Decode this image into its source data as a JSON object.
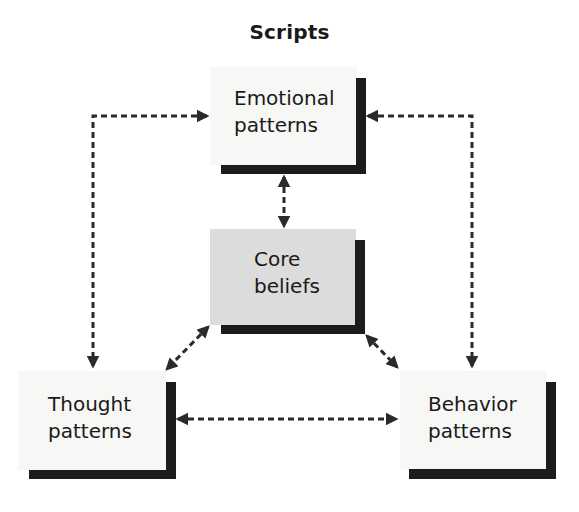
{
  "title": "Scripts",
  "nodes": {
    "emotional": {
      "line1": "Emotional",
      "line2": "patterns"
    },
    "core": {
      "line1": "Core",
      "line2": "beliefs"
    },
    "thought": {
      "line1": "Thought",
      "line2": "patterns"
    },
    "behavior": {
      "line1": "Behavior",
      "line2": "patterns"
    }
  },
  "connections": [
    {
      "from": "emotional",
      "to": "thought",
      "style": "dashed",
      "bidirectional": true
    },
    {
      "from": "emotional",
      "to": "behavior",
      "style": "dashed",
      "bidirectional": true
    },
    {
      "from": "emotional",
      "to": "core",
      "style": "dashed",
      "bidirectional": true
    },
    {
      "from": "core",
      "to": "thought",
      "style": "dashed",
      "bidirectional": true
    },
    {
      "from": "core",
      "to": "behavior",
      "style": "dashed",
      "bidirectional": true
    },
    {
      "from": "thought",
      "to": "behavior",
      "style": "dashed",
      "bidirectional": true
    }
  ],
  "colors": {
    "box_fill": "#f7f7f5",
    "core_fill": "#dcdcdc",
    "shadow": "#1c1c1c",
    "arrow": "#2a2a2a"
  }
}
